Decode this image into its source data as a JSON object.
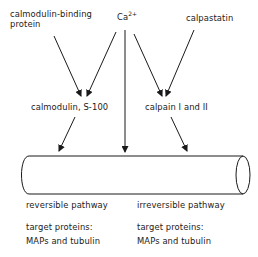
{
  "nodes": {
    "calmodulin_binding_protein": {
      "line1": "calmodulin-binding",
      "line2": "protein"
    },
    "calcium": {
      "base": "Ca",
      "superscript": "2+"
    },
    "calpastatin": {
      "label": "calpastatin"
    },
    "calmodulin_s100": {
      "label": "calmodulin, S-100"
    },
    "calpain": {
      "label": "calpain I and II"
    },
    "microtubule": {
      "label": ""
    }
  },
  "pathways": {
    "left": {
      "title": "reversible pathway",
      "targets_heading": "target proteins:",
      "targets": "MAPs and tubulin"
    },
    "right": {
      "title": "irreversible pathway",
      "targets_heading": "target proteins:",
      "targets": "MAPs and tubulin"
    }
  },
  "edges": [
    {
      "from": "calmodulin-binding protein",
      "to": "calmodulin, S-100"
    },
    {
      "from": "Ca2+",
      "to": "calmodulin, S-100"
    },
    {
      "from": "Ca2+",
      "to": "microtubule"
    },
    {
      "from": "Ca2+",
      "to": "calpain I and II"
    },
    {
      "from": "calpastatin",
      "to": "calpain I and II"
    },
    {
      "from": "calmodulin, S-100",
      "to": "microtubule"
    },
    {
      "from": "calpain I and II",
      "to": "microtubule"
    }
  ]
}
